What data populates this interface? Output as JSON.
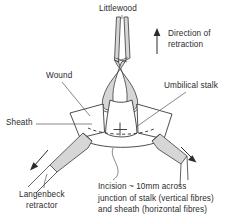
{
  "figure": {
    "title": "Littlewood",
    "labels": {
      "littlewood": "Littlewood",
      "direction_line1": "Direction of",
      "direction_line2": "retraction",
      "wound": "Wound",
      "sheath": "Sheath",
      "umbilical_stalk": "Umbilical stalk",
      "langenbeck_line1": "Langenbeck",
      "langenbeck_line2": "retractor",
      "incision_line1": "Incision ~ 10mm across",
      "incision_line2": "junction of stalk (vertical fibres)",
      "incision_line3": "and sheath (horizontal fibres)"
    },
    "icons": {
      "up_arrow": "direction-of-retraction-arrow",
      "left_arrow": "left-retraction-arrow",
      "right_arrow": "right-retraction-arrow"
    },
    "colors": {
      "ink": "#2b2b2b",
      "instrument_fill": "#d6d6d6",
      "instrument_stroke": "#3a3a3a",
      "tissue_fill": "#ffffff",
      "leader": "#555555",
      "background": "#ffffff"
    }
  }
}
